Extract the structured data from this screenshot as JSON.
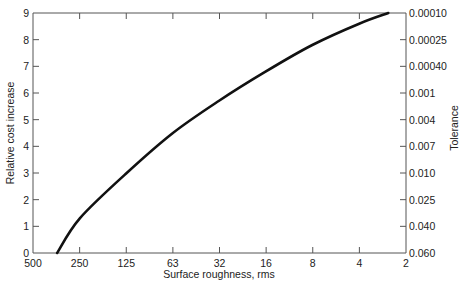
{
  "chart_data": {
    "type": "line",
    "title": "",
    "xlabel": "Surface roughness, rms",
    "ylabel": "Relative cost increase",
    "y2label": "Tolerance",
    "x_scale": "log2 (reversed)",
    "x_ticks": [
      "500",
      "250",
      "125",
      "63",
      "32",
      "16",
      "8",
      "4",
      "2"
    ],
    "y_ticks": [
      "0",
      "1",
      "2",
      "3",
      "4",
      "5",
      "6",
      "7",
      "8",
      "9"
    ],
    "y2_ticks": [
      "0.060",
      "0.040",
      "0.025",
      "0.010",
      "0.007",
      "0.004",
      "0.001",
      "0.00040",
      "0.00025",
      "0.00010"
    ],
    "ylim": [
      0,
      9
    ],
    "xlim": [
      500,
      2
    ],
    "grid": false,
    "legend": null,
    "series": [
      {
        "name": "Relative cost increase",
        "x": [
          350,
          250,
          125,
          63,
          32,
          16,
          8,
          4,
          2.6
        ],
        "values": [
          0,
          1.3,
          3.0,
          4.5,
          5.7,
          6.8,
          7.8,
          8.6,
          9.0
        ]
      }
    ]
  }
}
